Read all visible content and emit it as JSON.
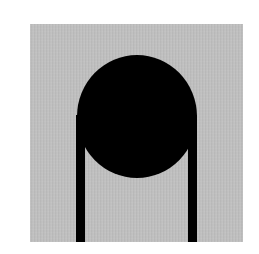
{
  "image": {
    "description": "Pictogram: black circle atop two vertical black bars on a gray square",
    "ghost_text": "",
    "colors": {
      "background": "#ffffff",
      "panel": "#bebebe",
      "figure": "#000000"
    },
    "shapes": [
      {
        "name": "gray-square",
        "x": 30,
        "y": 24,
        "width": 213,
        "height": 218
      },
      {
        "name": "black-circle",
        "cx": 137,
        "cy": 116,
        "diameter": 121
      },
      {
        "name": "left-bar",
        "x": 76,
        "y": 115,
        "width": 9,
        "height": 127
      },
      {
        "name": "right-bar",
        "x": 188,
        "y": 115,
        "width": 9,
        "height": 127
      }
    ]
  }
}
